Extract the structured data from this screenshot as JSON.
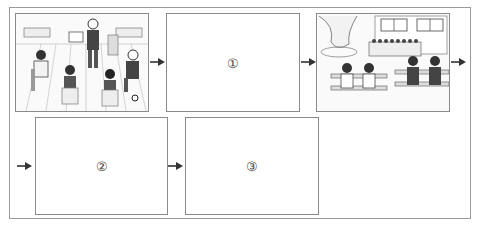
{
  "header": {
    "caption": ""
  },
  "panels": [
    {
      "id": "scene-1",
      "type": "illustration",
      "description": "classroom: boy presenting a picture to seated classmates"
    },
    {
      "id": "blank-1",
      "type": "blank",
      "label": "①"
    },
    {
      "id": "scene-3",
      "type": "illustration",
      "description": "schoolyard: girls and boys sitting on benches by a tree and flower bed"
    },
    {
      "id": "blank-2",
      "type": "blank",
      "label": "②"
    },
    {
      "id": "blank-3",
      "type": "blank",
      "label": "③"
    }
  ],
  "colors": {
    "line": "#8a8a8a",
    "arrow": "#333333",
    "frame": "#9a9a9a"
  }
}
